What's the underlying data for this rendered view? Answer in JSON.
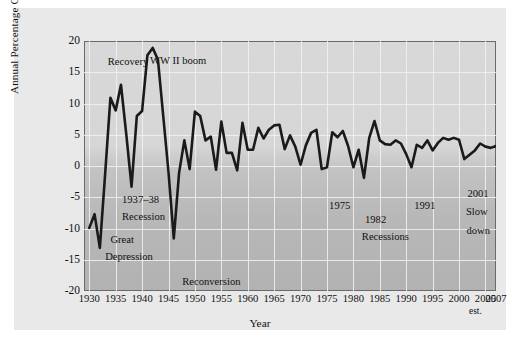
{
  "figure": {
    "background_color": "#e9e9e9",
    "plot_background_top": "#d8d8d8",
    "plot_background_bottom": "#b2b2b2",
    "line_color": "#1a1a1a",
    "gridline_color": "#f2f2f2",
    "border_color": "#6a6a6a"
  },
  "chart_data": {
    "type": "line",
    "title": "",
    "xlabel": "Year",
    "ylabel": "Annual Percentage Change in Real GDP",
    "xlim": [
      1929,
      2007
    ],
    "ylim": [
      -20,
      20
    ],
    "grid": true,
    "legend": "none",
    "y_ticks": [
      20,
      15,
      10,
      5,
      0,
      -5,
      -10,
      -15,
      -20
    ],
    "x_ticks": [
      1930,
      1935,
      1940,
      1945,
      1950,
      1955,
      1960,
      1965,
      1970,
      1975,
      1980,
      1985,
      1990,
      1995,
      2000,
      2005,
      2007
    ],
    "x_tick_note": "est.",
    "series": [
      {
        "name": "Annual Percentage Change in Real GDP",
        "x": [
          1930,
          1931,
          1932,
          1933,
          1934,
          1935,
          1936,
          1937,
          1938,
          1939,
          1940,
          1941,
          1942,
          1943,
          1944,
          1945,
          1946,
          1947,
          1948,
          1949,
          1950,
          1951,
          1952,
          1953,
          1954,
          1955,
          1956,
          1957,
          1958,
          1959,
          1960,
          1961,
          1962,
          1963,
          1964,
          1965,
          1966,
          1967,
          1968,
          1969,
          1970,
          1971,
          1972,
          1973,
          1974,
          1975,
          1976,
          1977,
          1978,
          1979,
          1980,
          1981,
          1982,
          1983,
          1984,
          1985,
          1986,
          1987,
          1988,
          1989,
          1990,
          1991,
          1992,
          1993,
          1994,
          1995,
          1996,
          1997,
          1998,
          1999,
          2000,
          2001,
          2002,
          2003,
          2004,
          2005,
          2006,
          2007
        ],
        "values": [
          -9.9,
          -7.7,
          -13.1,
          -1.3,
          10.9,
          8.9,
          13.0,
          5.1,
          -3.3,
          8.0,
          8.8,
          17.7,
          18.9,
          17.0,
          8.0,
          -1.0,
          -11.6,
          -1.1,
          4.1,
          -0.5,
          8.7,
          8.0,
          4.1,
          4.7,
          -0.6,
          7.1,
          2.1,
          2.1,
          -0.7,
          6.9,
          2.6,
          2.6,
          6.1,
          4.4,
          5.8,
          6.5,
          6.6,
          2.7,
          4.9,
          3.1,
          0.2,
          3.3,
          5.3,
          5.8,
          -0.5,
          -0.2,
          5.4,
          4.6,
          5.6,
          3.2,
          -0.2,
          2.6,
          -1.9,
          4.5,
          7.2,
          4.1,
          3.5,
          3.4,
          4.1,
          3.6,
          1.9,
          -0.2,
          3.4,
          2.9,
          4.1,
          2.5,
          3.7,
          4.5,
          4.2,
          4.5,
          4.2,
          1.1,
          1.8,
          2.5,
          3.6,
          3.1,
          2.9,
          3.2
        ]
      }
    ],
    "annotations": [
      {
        "text": "Recovery",
        "x": 1933.5,
        "y": 16.7
      },
      {
        "text": "WW II boom",
        "x": 1941.5,
        "y": 16.8
      },
      {
        "text": "1937–38",
        "x": 1936.2,
        "y": -5.5
      },
      {
        "text": "Recession",
        "x": 1936.2,
        "y": -8.2
      },
      {
        "text": "Great",
        "x": 1934.0,
        "y": -11.8
      },
      {
        "text": "Depression",
        "x": 1933.0,
        "y": -14.6
      },
      {
        "text": "Reconversion",
        "x": 1947.6,
        "y": -18.6
      },
      {
        "text": "1975",
        "x": 1975.4,
        "y": -6.4
      },
      {
        "text": "1982",
        "x": 1982.2,
        "y": -8.6
      },
      {
        "text": "Recessions",
        "x": 1981.6,
        "y": -11.4
      },
      {
        "text": "1991",
        "x": 1991.5,
        "y": -6.4
      },
      {
        "text": "2001",
        "x": 2001.6,
        "y": -4.4
      },
      {
        "text": "Slow",
        "x": 2001.3,
        "y": -7.4
      },
      {
        "text": "down",
        "x": 2001.4,
        "y": -10.4
      }
    ]
  }
}
